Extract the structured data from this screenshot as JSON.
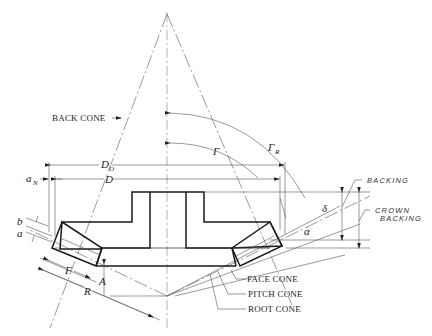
{
  "figure": {
    "labels": {
      "back_cone": "BACK CONE",
      "face_cone": "FACE CONE",
      "pitch_cone": "PITCH CONE",
      "root_cone": "ROOT CONE",
      "backing": "BACKING",
      "crown_backing_line1": "CROWN",
      "crown_backing_line2": "BACKING"
    },
    "symbols": {
      "outside_diameter": "D",
      "outside_diameter_sub": "O",
      "pitch_diameter": "D",
      "addendum_n": "a",
      "addendum_n_sub": "N",
      "dedendum": "b",
      "addendum": "a",
      "face_width": "F",
      "cone_distance": "R",
      "apex_distance": "A",
      "pitch_angle": "Γ",
      "face_angle": "Γ",
      "face_angle_sub": "R",
      "dedendum_angle": "δ",
      "addendum_angle": "α"
    }
  }
}
